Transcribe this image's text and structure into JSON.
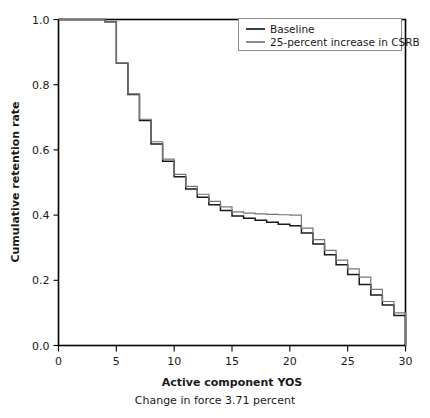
{
  "chart_data": {
    "type": "line",
    "title": "",
    "subtitle": "",
    "xlabel": "Active component YOS",
    "ylabel": "Cumulative retention rate",
    "caption": "Change in force 3.71 percent",
    "xlim": [
      0,
      30
    ],
    "ylim": [
      0.0,
      1.0
    ],
    "xticks": [
      0,
      5,
      10,
      15,
      20,
      25,
      30
    ],
    "xtick_labels": [
      "0",
      "5",
      "10",
      "15",
      "20",
      "25",
      "30"
    ],
    "yticks": [
      0.0,
      0.2,
      0.4,
      0.6,
      0.8,
      1.0
    ],
    "ytick_labels": [
      "0.0",
      "0.2",
      "0.4",
      "0.6",
      "0.8",
      "1.0"
    ],
    "grid": false,
    "step_style": "post",
    "legend_position": "top-right",
    "x": [
      0,
      1,
      2,
      3,
      4,
      5,
      6,
      7,
      8,
      9,
      10,
      11,
      12,
      13,
      14,
      15,
      16,
      17,
      18,
      19,
      20,
      21,
      22,
      23,
      24,
      25,
      26,
      27,
      28,
      29,
      30
    ],
    "series": [
      {
        "name": "Baseline",
        "color": "#1a1a1a",
        "values": [
          1.0,
          1.0,
          1.0,
          1.0,
          0.993,
          0.866,
          0.77,
          0.69,
          0.618,
          0.565,
          0.518,
          0.48,
          0.455,
          0.432,
          0.414,
          0.397,
          0.39,
          0.384,
          0.378,
          0.372,
          0.367,
          0.345,
          0.311,
          0.278,
          0.248,
          0.218,
          0.187,
          0.155,
          0.124,
          0.092,
          0.042
        ]
      },
      {
        "name": "25-percent increase in CSRB",
        "color": "#767676",
        "values": [
          1.0,
          1.0,
          1.0,
          1.0,
          0.993,
          0.866,
          0.772,
          0.694,
          0.625,
          0.572,
          0.525,
          0.488,
          0.464,
          0.442,
          0.425,
          0.41,
          0.406,
          0.404,
          0.402,
          0.401,
          0.4,
          0.36,
          0.325,
          0.292,
          0.262,
          0.235,
          0.21,
          0.172,
          0.135,
          0.1,
          0.048
        ]
      }
    ]
  },
  "legend": {
    "entries": [
      {
        "label": "Baseline",
        "swatch": "legend-swatch-baseline"
      },
      {
        "label": "25-percent increase in CSRB",
        "swatch": "legend-swatch-csrb"
      }
    ]
  },
  "colors": {
    "baseline": "#1a1a1a",
    "csrb": "#767676",
    "axis": "#000000",
    "background": "#ffffff"
  }
}
